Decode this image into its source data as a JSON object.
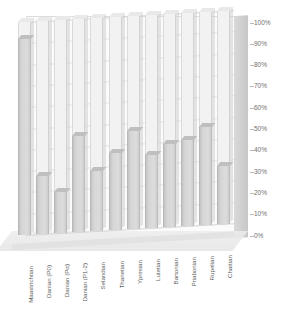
{
  "chart": {
    "title": "",
    "type_label": "3d-100-percent-bar-chart"
  },
  "chart_data": {
    "type": "bar",
    "title": "",
    "subtitle": "",
    "xlabel": "",
    "ylabel": "",
    "ylim": [
      0,
      100
    ],
    "grid": true,
    "legend": "none",
    "unit": "%",
    "categories": [
      "Maastrichtian",
      "Danian (P0)",
      "Danian (Pα)",
      "Danian (P1-2)",
      "Selandian",
      "Thanetian",
      "Ypresian",
      "Lutetian",
      "Bartonian",
      "Priabonian",
      "Rupelian",
      "Chattian"
    ],
    "values": [
      92,
      27,
      19,
      45,
      28,
      36,
      46,
      34,
      39,
      40,
      46,
      27
    ],
    "yticks": [
      "0%",
      "10%",
      "20%",
      "30%",
      "40%",
      "50%",
      "60%",
      "70%",
      "80%",
      "90%",
      "100%"
    ],
    "ytick_values": [
      0,
      10,
      20,
      30,
      40,
      50,
      60,
      70,
      80,
      90,
      100
    ]
  },
  "colors": {
    "bar_fill": "#d6d6d6",
    "bar_empty": "#f2f2f2",
    "gridline": "#e3e3e3",
    "axis_text": "#6f6f6f",
    "wall": "#cfcfcf"
  }
}
